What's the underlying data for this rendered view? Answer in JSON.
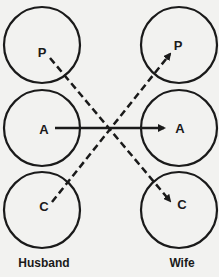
{
  "diagram": {
    "type": "transactional-analysis-ego-states",
    "left_person": {
      "caption": "Husband",
      "states": [
        "P",
        "A",
        "C"
      ]
    },
    "right_person": {
      "caption": "Wife",
      "states": [
        "P",
        "A",
        "C"
      ]
    },
    "transactions": [
      {
        "from": "Husband.A",
        "to": "Wife.A",
        "style": "solid"
      },
      {
        "from": "Husband.P",
        "to": "Wife.C",
        "style": "dashed"
      },
      {
        "from": "Husband.C",
        "to": "Wife.P",
        "style": "dashed"
      }
    ],
    "colors": {
      "stroke": "#1a1a1a",
      "background": "#f2f2f0"
    }
  }
}
